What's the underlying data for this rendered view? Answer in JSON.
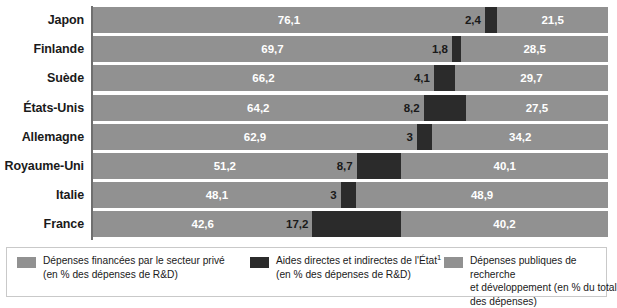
{
  "chart_data": {
    "type": "bar",
    "subtype": "stacked-horizontal-bar",
    "title": "",
    "xlabel": "",
    "ylabel": "",
    "xlim": [
      0,
      100
    ],
    "grid": false,
    "legend_position": "bottom",
    "categories": [
      "Japon",
      "Finlande",
      "Suède",
      "États-Unis",
      "Allemagne",
      "Royaume-Uni",
      "Italie",
      "France"
    ],
    "series": [
      {
        "name": "Dépenses financées par le secteur privé (en % des dépenses de R&D)",
        "color": "#919191",
        "values": [
          76.1,
          69.7,
          66.2,
          64.2,
          62.9,
          51.2,
          48.1,
          42.6
        ],
        "value_labels": [
          "76,1",
          "69,7",
          "66,2",
          "64,2",
          "62,9",
          "51,2",
          "48,1",
          "42,6"
        ]
      },
      {
        "name": "Aides directes et indirectes de l'État (en % des dépenses de R&D)",
        "color": "#2b2b2b",
        "values": [
          2.4,
          1.8,
          4.1,
          8.2,
          3.0,
          8.7,
          3.0,
          17.2
        ],
        "value_labels": [
          "2,4",
          "1,8",
          "4,1",
          "8,2",
          "3",
          "8,7",
          "3",
          "17,2"
        ]
      },
      {
        "name": "Dépenses publiques de recherche et développement (en % du total des dépenses)",
        "color": "#919191",
        "values": [
          21.5,
          28.5,
          29.7,
          27.5,
          34.2,
          40.1,
          48.9,
          40.2
        ],
        "value_labels": [
          "21,5",
          "28,5",
          "29,7",
          "27,5",
          "34,2",
          "40,1",
          "48,9",
          "40,2"
        ]
      }
    ]
  },
  "rows": [
    {
      "label": "Japon",
      "private": "76,1",
      "state": "2,4",
      "public": "21,5"
    },
    {
      "label": "Finlande",
      "private": "69,7",
      "state": "1,8",
      "public": "28,5"
    },
    {
      "label": "Suède",
      "private": "66,2",
      "state": "4,1",
      "public": "29,7"
    },
    {
      "label": "États-Unis",
      "private": "64,2",
      "state": "8,2",
      "public": "27,5"
    },
    {
      "label": "Allemagne",
      "private": "62,9",
      "state": "3",
      "public": "34,2"
    },
    {
      "label": "Royaume-Uni",
      "private": "51,2",
      "state": "8,7",
      "public": "40,1"
    },
    {
      "label": "Italie",
      "private": "48,1",
      "state": "3",
      "public": "48,9"
    },
    {
      "label": "France",
      "private": "42,6",
      "state": "17,2",
      "public": "40,2"
    }
  ],
  "legend": {
    "items": [
      {
        "swatch": "light-gray-swatch",
        "color": "#919191",
        "line1": "Dépenses financées par le secteur privé",
        "line2": "(en % des dépenses de R&D)",
        "footnote": ""
      },
      {
        "swatch": "dark-swatch",
        "color": "#2b2b2b",
        "line1": "Aides directes et indirectes de l'État",
        "line2": "(en % des dépenses de R&D)",
        "footnote": "1"
      },
      {
        "swatch": "light-gray-swatch",
        "color": "#919191",
        "line1": "Dépenses publiques de recherche",
        "line2": "et développement (en % du total",
        "line3": "des dépenses)",
        "footnote": ""
      }
    ]
  }
}
